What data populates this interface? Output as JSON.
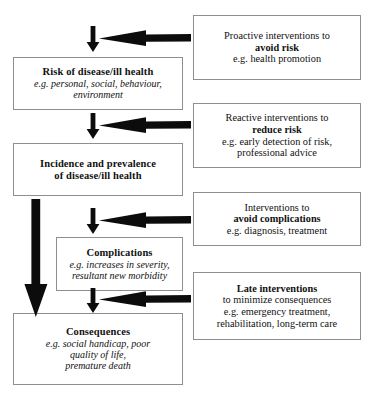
{
  "diagram": {
    "left_chain": [
      {
        "name": "risk",
        "heading": "Risk of disease/ill health",
        "lines": [
          "e.g. personal, social, behaviour,",
          "environment"
        ]
      },
      {
        "name": "incidence",
        "heading": "Incidence and prevalence",
        "lines": [
          "of disease/ill health"
        ]
      },
      {
        "name": "complications",
        "heading": "Complications",
        "lines": [
          "e.g. increases in severity,",
          "resultant new morbidity"
        ]
      },
      {
        "name": "consequences",
        "heading": "Consequences",
        "lines": [
          "e.g. social handicap, poor",
          "quality of life,",
          "premature death"
        ]
      }
    ],
    "right_interventions": [
      {
        "name": "proactive",
        "line1": "Proactive interventions to",
        "emphasis": "avoid risk",
        "line3": "e.g. health promotion",
        "line4": ""
      },
      {
        "name": "reactive",
        "line1": "Reactive interventions to",
        "emphasis": "reduce risk",
        "line3": "e.g. early detection of risk,",
        "line4": "professional advice"
      },
      {
        "name": "avoid-complications",
        "line1": "Interventions to",
        "emphasis": "avoid complications",
        "line3": "e.g. diagnosis, treatment",
        "line4": ""
      },
      {
        "name": "late-interventions",
        "line1": "",
        "emphasis": "Late interventions",
        "line3": "to minimize consequences",
        "line4": "e.g. emergency treatment,",
        "line5": "rehabilitation, long-term care"
      }
    ],
    "arrow_labels": {
      "down_risk": "down-arrow-to-risk",
      "down_incidence": "down-arrow-to-incidence",
      "down_complications": "down-arrow-to-complications",
      "down_consequences": "down-arrow-to-consequences",
      "bypass": "long-bypass-arrow-to-consequences",
      "in_risk": "intervention-arrow-avoid-risk",
      "in_incidence": "intervention-arrow-reduce-risk",
      "in_complications": "intervention-arrow-avoid-complications",
      "in_consequences": "intervention-arrow-late"
    },
    "colors": {
      "ink": "#0c0c0c",
      "box_border": "#8e8e8e",
      "background": "#ffffff"
    }
  }
}
